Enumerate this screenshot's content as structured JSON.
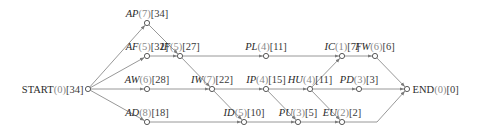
{
  "diagram": {
    "type": "activity-network",
    "colors": {
      "edge": "#8c8c8c",
      "node": "#4a4a4a",
      "name": "#2a2a2a",
      "duration": "#8a8a8a",
      "bracket": "#3a3a3a"
    },
    "nodes": [
      {
        "id": "START",
        "name": "START",
        "italic": false,
        "duration": "(0)",
        "bracket": "[34]",
        "x": 88,
        "y": 89,
        "label_side": "left"
      },
      {
        "id": "AP",
        "name": "AP",
        "italic": true,
        "duration": "(7)",
        "bracket": "[34]",
        "x": 147,
        "y": 23
      },
      {
        "id": "AF",
        "name": "AF",
        "italic": true,
        "duration": "(5)",
        "bracket": "[32]",
        "x": 147,
        "y": 56
      },
      {
        "id": "AW",
        "name": "AW",
        "italic": true,
        "duration": "(6)",
        "bracket": "[28]",
        "x": 147,
        "y": 89
      },
      {
        "id": "AD",
        "name": "AD",
        "italic": true,
        "duration": "(8)",
        "bracket": "[18]",
        "x": 147,
        "y": 122
      },
      {
        "id": "IF",
        "name": "IF",
        "italic": true,
        "duration": "(5)",
        "bracket": "[27]",
        "x": 180,
        "y": 56
      },
      {
        "id": "IW",
        "name": "IW",
        "italic": true,
        "duration": "(7)",
        "bracket": "[22]",
        "x": 212,
        "y": 89
      },
      {
        "id": "ID",
        "name": "ID",
        "italic": true,
        "duration": "(5)",
        "bracket": "[10]",
        "x": 244,
        "y": 122
      },
      {
        "id": "PL",
        "name": "PL",
        "italic": true,
        "duration": "(4)",
        "bracket": "[11]",
        "x": 266,
        "y": 56
      },
      {
        "id": "IP",
        "name": "IP",
        "italic": true,
        "duration": "(4)",
        "bracket": "[15]",
        "x": 266,
        "y": 89
      },
      {
        "id": "PU",
        "name": "PU",
        "italic": true,
        "duration": "(3)",
        "bracket": "[5]",
        "x": 298,
        "y": 122
      },
      {
        "id": "HU",
        "name": "HU",
        "italic": true,
        "duration": "(4)",
        "bracket": "[11]",
        "x": 310,
        "y": 89
      },
      {
        "id": "IC",
        "name": "IC",
        "italic": true,
        "duration": "(1)",
        "bracket": "[7]",
        "x": 342,
        "y": 56
      },
      {
        "id": "EU",
        "name": "EU",
        "italic": true,
        "duration": "(2)",
        "bracket": "[2]",
        "x": 342,
        "y": 122
      },
      {
        "id": "PD",
        "name": "PD",
        "italic": true,
        "duration": "(3)",
        "bracket": "[3]",
        "x": 359,
        "y": 89
      },
      {
        "id": "FW",
        "name": "FW",
        "italic": true,
        "duration": "(6)",
        "bracket": "[6]",
        "x": 375,
        "y": 56
      },
      {
        "id": "END",
        "name": "END",
        "italic": false,
        "duration": "(0)",
        "bracket": "[0]",
        "x": 407,
        "y": 89,
        "label_side": "right"
      }
    ],
    "edges": [
      [
        "START",
        "AP"
      ],
      [
        "START",
        "AF"
      ],
      [
        "START",
        "AW"
      ],
      [
        "START",
        "AD"
      ],
      [
        "AP",
        "IF"
      ],
      [
        "AF",
        "IF"
      ],
      [
        "IF",
        "PL"
      ],
      [
        "IF",
        "IW"
      ],
      [
        "AW",
        "IW"
      ],
      [
        "IW",
        "IP"
      ],
      [
        "IW",
        "ID"
      ],
      [
        "AD",
        "ID"
      ],
      [
        "PL",
        "IC"
      ],
      [
        "IP",
        "HU"
      ],
      [
        "IP",
        "PU"
      ],
      [
        "ID",
        "PU"
      ],
      [
        "HU",
        "IC"
      ],
      [
        "HU",
        "PD"
      ],
      [
        "HU",
        "EU"
      ],
      [
        "PU",
        "EU"
      ],
      [
        "IC",
        "FW"
      ],
      [
        "FW",
        "END"
      ],
      [
        "PD",
        "END"
      ],
      [
        "EU",
        "END"
      ]
    ]
  }
}
